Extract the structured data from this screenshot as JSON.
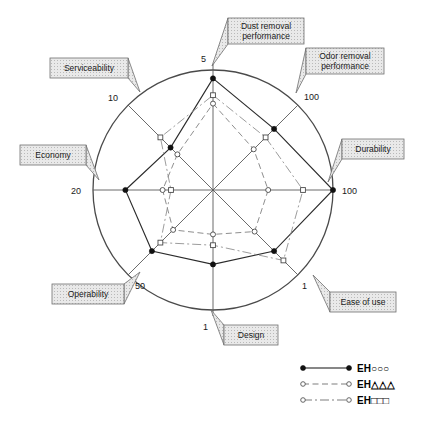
{
  "chart_data": {
    "type": "radar",
    "title": "",
    "subtitle": "",
    "xlabel": "",
    "ylabel": "",
    "grid": false,
    "legend_position": "bottom-right",
    "axis_count": 8,
    "categories": [
      "Dust removal performance",
      "Odor removal performance",
      "Durability",
      "Ease of use",
      "Design",
      "Operability",
      "Economy",
      "Serviceability"
    ],
    "axis_max_labels": [
      "5",
      "100",
      "100",
      "1",
      "1",
      "50",
      "20",
      "10"
    ],
    "axis_label_angles_deg": [
      90,
      45,
      0,
      -45,
      -90,
      -135,
      180,
      135
    ],
    "series": [
      {
        "name": "EH○○○",
        "line_style": "solid",
        "marker": "filled-circle",
        "values": [
          0.93,
          0.72,
          1.0,
          0.72,
          0.62,
          0.72,
          0.73,
          0.5
        ]
      },
      {
        "name": "EH△△△",
        "line_style": "dashed",
        "marker": "open-circle",
        "values": [
          0.72,
          0.48,
          0.46,
          0.49,
          0.37,
          0.47,
          0.42,
          0.42
        ]
      },
      {
        "name": "EH□□□",
        "line_style": "dash-dot",
        "marker": "open-square",
        "values": [
          0.79,
          0.62,
          0.75,
          0.83,
          0.46,
          0.62,
          0.35,
          0.62
        ]
      }
    ]
  },
  "callouts": [
    {
      "id": "dust-removal-performance",
      "label": "Dust removal\nperformance",
      "line1": "Dust removal",
      "line2": "performance",
      "tick": "5"
    },
    {
      "id": "odor-removal-performance",
      "label": "Odor removal\nperformance",
      "line1": "Odor removal",
      "line2": "performance",
      "tick": "100"
    },
    {
      "id": "durability",
      "label": "Durability",
      "line1": "Durability",
      "line2": "",
      "tick": "100"
    },
    {
      "id": "ease-of-use",
      "label": "Ease of use",
      "line1": "Ease of use",
      "line2": "",
      "tick": "1"
    },
    {
      "id": "design",
      "label": "Design",
      "line1": "Design",
      "line2": "",
      "tick": "1"
    },
    {
      "id": "operability",
      "label": "Operability",
      "line1": "Operability",
      "line2": "",
      "tick": "50"
    },
    {
      "id": "economy",
      "label": "Economy",
      "line1": "Economy",
      "line2": "",
      "tick": "20"
    },
    {
      "id": "serviceability",
      "label": "Serviceability",
      "line1": "Serviceability",
      "line2": "",
      "tick": "10"
    }
  ],
  "legend": {
    "entries": [
      {
        "label": "EH○○○",
        "style": "solid",
        "marker": "filled-circle"
      },
      {
        "label": "EH△△△",
        "style": "dashed",
        "marker": "open-circle"
      },
      {
        "label": "EH□□□",
        "style": "dash-dot",
        "marker": "open-square"
      }
    ]
  },
  "colors": {
    "outline": "#4a4a4a",
    "series1": "#2b2b2b",
    "series2": "#7a7a7a",
    "series3": "#8a8a8a",
    "callout_fill": "#e4e4e4",
    "callout_stroke": "#6f6f6f",
    "text": "#1a1a1a",
    "background": "#ffffff"
  }
}
